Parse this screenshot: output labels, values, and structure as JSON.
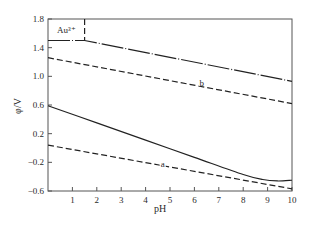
{
  "chart_data": {
    "type": "line",
    "title": "",
    "xlabel": "pH",
    "ylabel": "φ/V",
    "xlim": [
      0,
      10
    ],
    "ylim": [
      -0.6,
      1.8
    ],
    "x_ticks": [
      1,
      2,
      3,
      4,
      5,
      6,
      7,
      8,
      9,
      10
    ],
    "y_ticks": [
      1.8,
      1.4,
      1.0,
      0.6,
      0.2,
      -0.2,
      -0.6
    ],
    "y_tick_labels": [
      "1.8",
      "1.4",
      "1.0",
      "0.6",
      "0.2",
      "-0.2",
      "-0.6"
    ],
    "x_tick_labels": [
      "1",
      "2",
      "3",
      "4",
      "5",
      "6",
      "7",
      "8",
      "9",
      "10"
    ],
    "grid": false,
    "legend": null,
    "annotations": [
      {
        "text": "Au³⁺",
        "x": 0.75,
        "y": 1.65
      },
      {
        "text": "b",
        "x": 6.3,
        "y": 0.91
      },
      {
        "text": "a",
        "x": 4.7,
        "y": -0.23
      }
    ],
    "series": [
      {
        "name": "Au3+/Au boundary",
        "style": "dash-dot",
        "x": [
          0,
          1.5,
          10
        ],
        "y": [
          1.5,
          1.5,
          0.93
        ]
      },
      {
        "name": "Au3+ region divider",
        "style": "dashed",
        "x": [
          1.5,
          1.5
        ],
        "y": [
          1.8,
          1.5
        ]
      },
      {
        "name": "b",
        "style": "dashed",
        "x": [
          0,
          10
        ],
        "y": [
          1.26,
          0.62
        ]
      },
      {
        "name": "solid boundary",
        "style": "solid",
        "x": [
          0,
          2,
          4,
          6,
          8,
          8.8,
          9.4,
          10
        ],
        "y": [
          0.59,
          0.35,
          0.11,
          -0.13,
          -0.37,
          -0.44,
          -0.46,
          -0.45
        ]
      },
      {
        "name": "a",
        "style": "dashed",
        "x": [
          0,
          10
        ],
        "y": [
          0.04,
          -0.57
        ]
      }
    ]
  }
}
